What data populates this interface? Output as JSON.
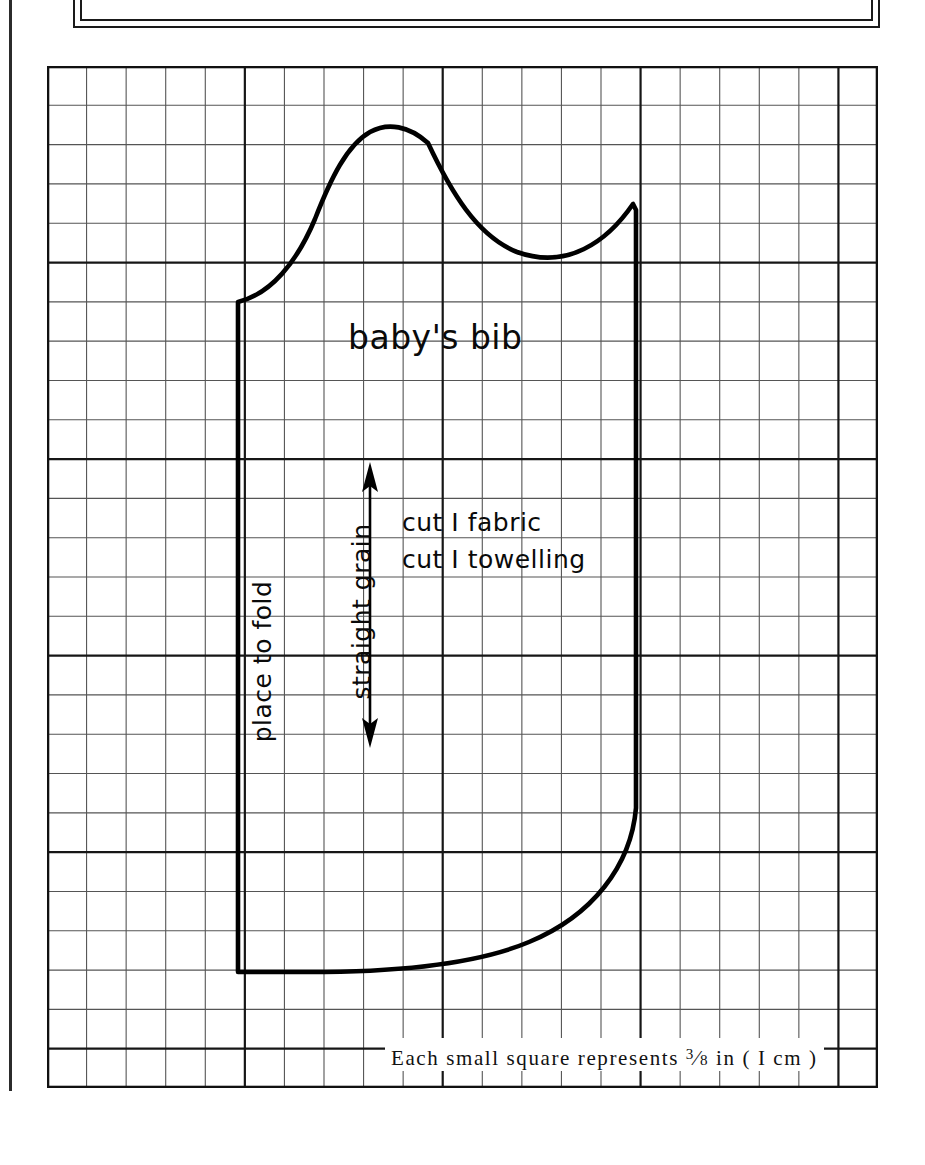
{
  "page": {
    "background_color": "#ffffff",
    "ink_color": "#000000",
    "width": 925,
    "height": 1165
  },
  "grid": {
    "columns": 21,
    "rows": 26,
    "cell_size_px": 39.6,
    "major_every": 5,
    "minor_color": "#4a4a4a",
    "major_color": "#1a1a1a",
    "left": 47,
    "top": 66,
    "width": 831,
    "height": 1022
  },
  "pattern": {
    "name": "baby's bib",
    "title_label": "baby's bib",
    "cut_instructions": [
      "cut I fabric",
      "cut I towelling"
    ],
    "fold_label": "place to fold",
    "grain_label": "straight grain",
    "outline_color": "#000000",
    "outline_width_px": 5
  },
  "grain_arrow": {
    "name": "straight-grain-arrow",
    "orientation": "vertical",
    "double_headed": true,
    "x": 370,
    "y_top": 464,
    "y_bottom": 744
  },
  "caption": {
    "text_before": "Each small square represents ",
    "fraction_numerator": "3",
    "fraction_denominator": "8",
    "text_after": " in  ( I  cm )",
    "full_text": "Each small square represents 3/8 in (I cm)"
  },
  "frame": {
    "name": "top-border-frame",
    "style": "double-rule rectangle"
  }
}
